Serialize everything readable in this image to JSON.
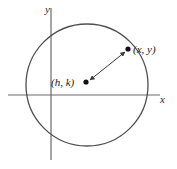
{
  "figure": {
    "background_color": "#ffffff",
    "width": 177,
    "height": 169
  },
  "axes": {
    "x_label": "x",
    "y_label": "y",
    "axis_color": "#6b6b6b",
    "x_axis": {
      "y": 95,
      "x_start": 8,
      "x_end": 160
    },
    "y_axis": {
      "x": 51,
      "y_start": 8,
      "y_end": 160
    }
  },
  "circle": {
    "center_x": 87,
    "center_y": 85,
    "radius": 61,
    "stroke_color": "#4f4f4f",
    "stroke_width": 1.3,
    "fill": "none"
  },
  "points": [
    {
      "name": "center-point",
      "label": "(h, k)",
      "cx": 86,
      "cy": 82,
      "r": 2.6,
      "color": "#111111",
      "label_x": 51,
      "label_y": 86,
      "label_anchor": "start"
    },
    {
      "name": "circumference-point",
      "label": "(x, y)",
      "cx": 128,
      "cy": 49,
      "r": 2.6,
      "color": "#111111",
      "label_x": 133,
      "label_y": 53,
      "label_anchor": "start"
    }
  ],
  "radius_arrow": {
    "name": "radius-double-arrow",
    "from_x": 90,
    "from_y": 80,
    "to_x": 125,
    "to_y": 52,
    "color": "#3a3a3a",
    "stroke_width": 1.0,
    "double_headed": true
  }
}
